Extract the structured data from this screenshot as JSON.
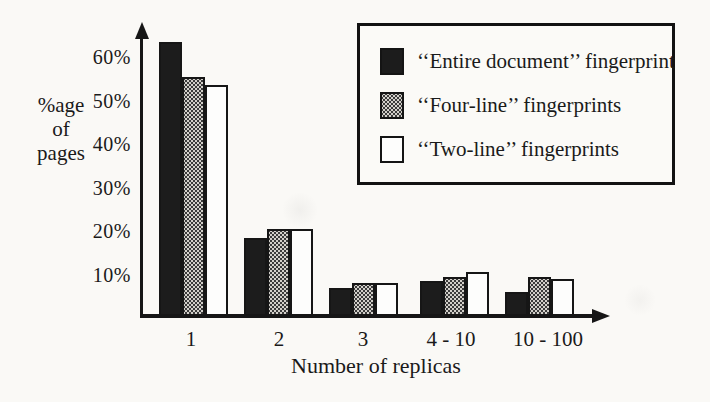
{
  "figure": {
    "background": "#faf9f6",
    "ink_color": "#161616",
    "halftone_gray": "#d3d0ca"
  },
  "chart_data": {
    "type": "bar",
    "title": "",
    "xlabel": "Number of replicas",
    "ylabel": "%age of pages",
    "ylabel_lines": [
      "%age",
      "of",
      "pages"
    ],
    "categories": [
      "1",
      "2",
      "3",
      "4 - 10",
      "10 - 100"
    ],
    "series": [
      {
        "name": "‘‘Entire document’’ fingerprint",
        "style": "solid-black",
        "values": [
          63,
          18,
          6.5,
          8,
          5.5
        ]
      },
      {
        "name": "‘‘Four-line’’ fingerprints",
        "style": "halftone-gray",
        "values": [
          55,
          20,
          7.5,
          9,
          9
        ]
      },
      {
        "name": "‘‘Two-line’’ fingerprints",
        "style": "white",
        "values": [
          53,
          20,
          7.5,
          10,
          8.5
        ]
      }
    ],
    "yticks": [
      "60%",
      "50%",
      "40%",
      "30%",
      "20%",
      "10%"
    ],
    "ytick_values": [
      60,
      50,
      40,
      30,
      20,
      10
    ],
    "ylim": [
      0,
      68
    ],
    "grid": false,
    "legend_position": "top-right",
    "unit": "percent of pages"
  },
  "legend": {
    "items": [
      {
        "label": "‘‘Entire document’’ fingerprint",
        "swatch": "solid-black"
      },
      {
        "label": "‘‘Four-line’’ fingerprints",
        "swatch": "halftone-gray"
      },
      {
        "label": "‘‘Two-line’’ fingerprints",
        "swatch": "white"
      }
    ]
  }
}
